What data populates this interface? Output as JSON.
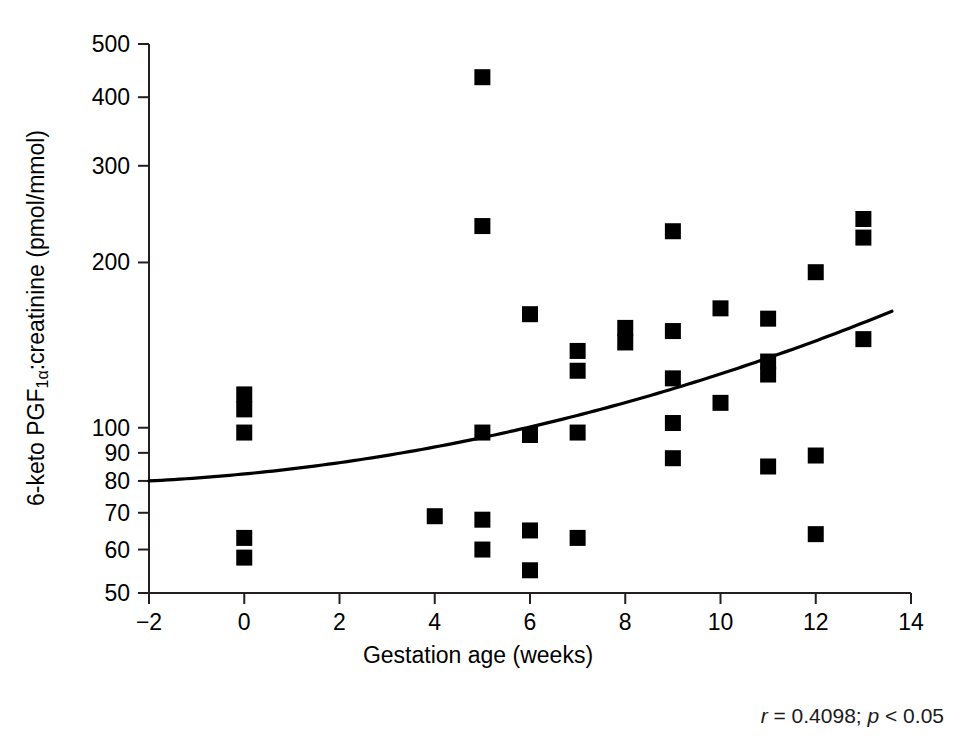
{
  "chart_data": {
    "type": "scatter",
    "title": "",
    "xlabel": "Gestation age (weeks)",
    "ylabel": "6-keto PGF1α:creatinine (pmol/mmol)",
    "ylabel_parts": {
      "prefix": "6-keto PGF",
      "subscript": "1α",
      "suffix": ":creatinine (pmol/mmol)"
    },
    "xscale": "linear",
    "yscale": "log",
    "xlim": [
      -2,
      14
    ],
    "ylim": [
      50,
      500
    ],
    "grid": false,
    "legend": null,
    "xticks": [
      -2,
      0,
      2,
      4,
      6,
      8,
      10,
      12,
      14
    ],
    "xtick_labels": [
      "−2",
      "0",
      "2",
      "4",
      "6",
      "8",
      "10",
      "12",
      "14"
    ],
    "yticks": [
      50,
      60,
      70,
      80,
      90,
      100,
      200,
      300,
      400,
      500
    ],
    "ytick_labels": [
      "50",
      "60",
      "70",
      "80",
      "90",
      "100",
      "200",
      "300",
      "400",
      "500"
    ],
    "marker_style": "filled-square",
    "marker_color": "#000000",
    "points": [
      {
        "x": 0,
        "y": 115
      },
      {
        "x": 0,
        "y": 108
      },
      {
        "x": 0,
        "y": 98
      },
      {
        "x": 0,
        "y": 63
      },
      {
        "x": 0,
        "y": 58
      },
      {
        "x": 4,
        "y": 69
      },
      {
        "x": 5,
        "y": 435
      },
      {
        "x": 5,
        "y": 233
      },
      {
        "x": 5,
        "y": 98
      },
      {
        "x": 5,
        "y": 68
      },
      {
        "x": 5,
        "y": 60
      },
      {
        "x": 6,
        "y": 161
      },
      {
        "x": 6,
        "y": 97
      },
      {
        "x": 6,
        "y": 65
      },
      {
        "x": 6,
        "y": 55
      },
      {
        "x": 7,
        "y": 138
      },
      {
        "x": 7,
        "y": 127
      },
      {
        "x": 7,
        "y": 98
      },
      {
        "x": 7,
        "y": 63
      },
      {
        "x": 8,
        "y": 152
      },
      {
        "x": 8,
        "y": 143
      },
      {
        "x": 9,
        "y": 228
      },
      {
        "x": 9,
        "y": 150
      },
      {
        "x": 9,
        "y": 123
      },
      {
        "x": 9,
        "y": 102
      },
      {
        "x": 9,
        "y": 88
      },
      {
        "x": 10,
        "y": 165
      },
      {
        "x": 10,
        "y": 111
      },
      {
        "x": 11,
        "y": 158
      },
      {
        "x": 11,
        "y": 132
      },
      {
        "x": 11,
        "y": 125
      },
      {
        "x": 11,
        "y": 85
      },
      {
        "x": 12,
        "y": 192
      },
      {
        "x": 12,
        "y": 89
      },
      {
        "x": 12,
        "y": 64
      },
      {
        "x": 13,
        "y": 240
      },
      {
        "x": 13,
        "y": 222
      },
      {
        "x": 13,
        "y": 145
      }
    ],
    "fit_curve": {
      "kind": "exponential-trend",
      "x_start": -2,
      "x_end": 13.6,
      "y_start": 80,
      "y_end": 163
    },
    "annotation": {
      "r_symbol": "r",
      "r_text": " = 0.4098; ",
      "p_symbol": "p",
      "p_text": " < 0.05",
      "full": "r = 0.4098; p < 0.05"
    }
  },
  "figure": {
    "background": "#ffffff",
    "axis_color": "#231f20"
  }
}
